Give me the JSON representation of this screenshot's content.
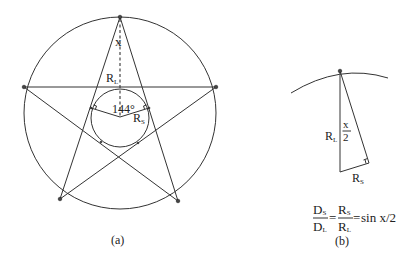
{
  "figure_a": {
    "caption": "(a)",
    "labels": {
      "apex_angle": "x",
      "large_radius": "R",
      "large_radius_sub": "L",
      "central_angle": "144°",
      "small_radius": "R",
      "small_radius_sub": "S"
    }
  },
  "figure_b": {
    "caption": "(b)",
    "labels": {
      "half_angle_num": "x",
      "half_angle_den": "2",
      "large_radius": "R",
      "large_radius_sub": "L",
      "small_radius": "R",
      "small_radius_sub": "S"
    },
    "formula": {
      "lhs_num": "D",
      "lhs_num_sub": "S",
      "lhs_den": "D",
      "lhs_den_sub": "L",
      "eq1": "=",
      "mid_num": "R",
      "mid_num_sub": "S",
      "mid_den": "R",
      "mid_den_sub": "L",
      "eq2": "=",
      "rhs": "sin x/2"
    }
  }
}
